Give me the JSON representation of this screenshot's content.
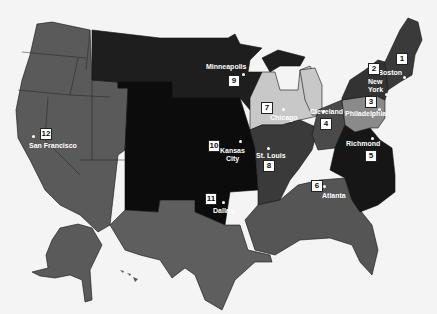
{
  "map": {
    "title": "Federal Reserve Districts",
    "colors": {
      "background": "#f4f4f4",
      "west": "#5a5a5a",
      "plains_black": "#0c0c0c",
      "north_dark": "#1e1e1e",
      "chicago_light": "#c8c8c8",
      "stlouis": "#3a3a3a",
      "cleveland": "#4a4a4a",
      "richmond": "#161616",
      "philadelphia": "#8a8a8a",
      "newyork": "#333333",
      "boston": "#3a3a3a",
      "atlanta": "#555555",
      "dallas": "#5e5e5e",
      "border": "#111111"
    },
    "districts": [
      {
        "number": "1",
        "city": "Boston"
      },
      {
        "number": "2",
        "city": "New York"
      },
      {
        "number": "3",
        "city": "Philadelphia"
      },
      {
        "number": "4",
        "city": "Cleveland"
      },
      {
        "number": "5",
        "city": "Richmond"
      },
      {
        "number": "6",
        "city": "Atlanta"
      },
      {
        "number": "7",
        "city": "Chicago"
      },
      {
        "number": "8",
        "city": "St. Louis"
      },
      {
        "number": "9",
        "city": "Minneapolis"
      },
      {
        "number": "10",
        "city": "Kansas City"
      },
      {
        "number": "11",
        "city": "Dallas"
      },
      {
        "number": "12",
        "city": "San Francisco"
      }
    ],
    "labels": {
      "boston": "Boston",
      "new_york_1": "New",
      "new_york_2": "York",
      "philadelphia": "Philadelphia",
      "cleveland": "Cleveland",
      "richmond": "Richmond",
      "atlanta": "Atlanta",
      "chicago": "Chicago",
      "st_louis": "St. Louis",
      "minneapolis": "Minneapolis",
      "kansas_city_1": "Kansas",
      "kansas_city_2": "City",
      "dallas": "Dallas",
      "san_francisco": "San Francisco"
    }
  }
}
